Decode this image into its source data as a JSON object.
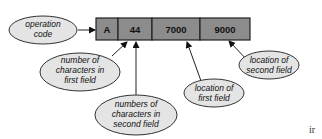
{
  "diagram": {
    "instruction_fields": [
      {
        "value": "A"
      },
      {
        "value": "44"
      },
      {
        "value": "7000"
      },
      {
        "value": "9000"
      }
    ],
    "labels": {
      "operation_code": [
        "operation",
        "code"
      ],
      "chars_first_field": [
        "number of",
        "characters in",
        "first field"
      ],
      "chars_second_field": [
        "numbers of",
        "characters in",
        "second field"
      ],
      "location_first_field": [
        "location of",
        "first field"
      ],
      "location_second_field": [
        "location of",
        "second field"
      ]
    },
    "colors": {
      "cell_fill": "#8c8c8c",
      "ellipse_fill": "#e4e4e4"
    }
  },
  "footer_mark": "ir"
}
